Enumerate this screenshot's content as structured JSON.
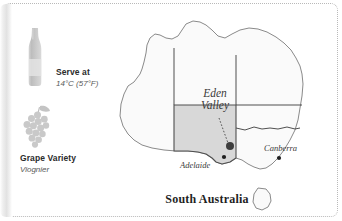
{
  "card": {
    "border_color": "#b9b9b9",
    "background": "#ffffff"
  },
  "info": {
    "serve": {
      "icon": "wine-bottle-icon",
      "label": "Serve at",
      "value": "14°C (57°F)"
    },
    "variety": {
      "icon": "grape-cluster-icon",
      "label": "Grape Variety",
      "value": "Viognier"
    }
  },
  "map": {
    "title": "South Australia",
    "region_label_line1": "Eden",
    "region_label_line2": "Valley",
    "cities": [
      {
        "name": "Adelaide"
      },
      {
        "name": "Canberra"
      }
    ],
    "colors": {
      "land_fill": "#fafafa",
      "highlight_fill": "#d8d8d8",
      "outline": "#6e6e6e",
      "marker": "#3d3d3d"
    }
  }
}
